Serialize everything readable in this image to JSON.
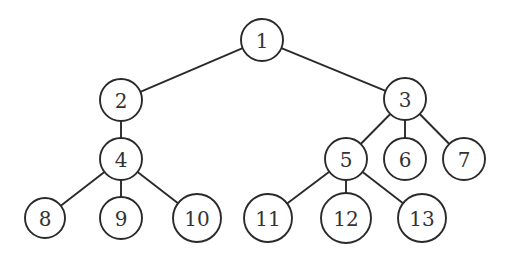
{
  "diagram": {
    "type": "tree",
    "stroke_color": "#2a2a2a",
    "label_color": "#333333",
    "background": "#ffffff",
    "nodes": [
      {
        "id": "1",
        "label": "1",
        "x": 262,
        "y": 40,
        "r": 21
      },
      {
        "id": "2",
        "label": "2",
        "x": 121,
        "y": 100,
        "r": 21
      },
      {
        "id": "3",
        "label": "3",
        "x": 405,
        "y": 99,
        "r": 21
      },
      {
        "id": "4",
        "label": "4",
        "x": 121,
        "y": 159,
        "r": 21
      },
      {
        "id": "5",
        "label": "5",
        "x": 346,
        "y": 159,
        "r": 21
      },
      {
        "id": "6",
        "label": "6",
        "x": 405,
        "y": 159,
        "r": 21
      },
      {
        "id": "7",
        "label": "7",
        "x": 464,
        "y": 159,
        "r": 21
      },
      {
        "id": "8",
        "label": "8",
        "x": 45,
        "y": 218,
        "r": 20
      },
      {
        "id": "9",
        "label": "9",
        "x": 121,
        "y": 218,
        "r": 21
      },
      {
        "id": "10",
        "label": "10",
        "x": 197,
        "y": 218,
        "r": 24
      },
      {
        "id": "11",
        "label": "11",
        "x": 268,
        "y": 218,
        "r": 24
      },
      {
        "id": "12",
        "label": "12",
        "x": 346,
        "y": 218,
        "r": 25
      },
      {
        "id": "13",
        "label": "13",
        "x": 422,
        "y": 218,
        "r": 24
      }
    ],
    "edges": [
      {
        "from": "1",
        "to": "2"
      },
      {
        "from": "1",
        "to": "3"
      },
      {
        "from": "2",
        "to": "4"
      },
      {
        "from": "3",
        "to": "5"
      },
      {
        "from": "3",
        "to": "6"
      },
      {
        "from": "3",
        "to": "7"
      },
      {
        "from": "4",
        "to": "8"
      },
      {
        "from": "4",
        "to": "9"
      },
      {
        "from": "4",
        "to": "10"
      },
      {
        "from": "5",
        "to": "11"
      },
      {
        "from": "5",
        "to": "12"
      },
      {
        "from": "5",
        "to": "13"
      }
    ]
  }
}
